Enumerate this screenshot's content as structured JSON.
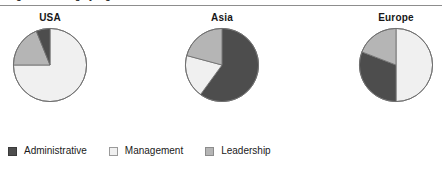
{
  "figure": {
    "caption_fragment": "Figure 3  Staffing by region",
    "rule_color": "#8d8d8d",
    "background": "#ffffff"
  },
  "legend": {
    "position": "bottom-left",
    "items": [
      {
        "label": "Administrative",
        "color": "#4d4d4d",
        "border": "#3a3a3a",
        "swatch_name": "swatch-administrative"
      },
      {
        "label": "Management",
        "color": "#f0f0f0",
        "border": "#9a9a9a",
        "swatch_name": "swatch-management"
      },
      {
        "label": "Leadership",
        "color": "#b5b5b5",
        "border": "#8c8c8c",
        "swatch_name": "swatch-leadership"
      }
    ]
  },
  "chart_data": {
    "type": "pie",
    "title": "Figure 3  Staffing by region",
    "xlabel": "",
    "ylabel": "",
    "grid": false,
    "legend_position": "bottom-left",
    "categories": [
      "Administrative",
      "Management",
      "Leadership"
    ],
    "colors": {
      "Administrative": "#4d4d4d",
      "Management": "#f0f0f0",
      "Leadership": "#b5b5b5"
    },
    "units": "percent",
    "charts": [
      {
        "title": "USA",
        "center_x": 50,
        "center_y": 75,
        "radius": 38,
        "slices": [
          {
            "name": "Management",
            "value": 75,
            "start_deg": 0,
            "end_deg": 270,
            "color": "#f0f0f0"
          },
          {
            "name": "Leadership",
            "value": 19,
            "start_deg": 270,
            "end_deg": 338,
            "color": "#b5b5b5"
          },
          {
            "name": "Administrative",
            "value": 6,
            "start_deg": 338,
            "end_deg": 360,
            "color": "#4d4d4d"
          }
        ]
      },
      {
        "title": "Asia",
        "center_x": 222,
        "center_y": 75,
        "radius": 38,
        "slices": [
          {
            "name": "Administrative",
            "value": 60,
            "start_deg": 0,
            "end_deg": 216,
            "color": "#4d4d4d"
          },
          {
            "name": "Management",
            "value": 19,
            "start_deg": 216,
            "end_deg": 285,
            "color": "#f0f0f0"
          },
          {
            "name": "Leadership",
            "value": 21,
            "start_deg": 285,
            "end_deg": 360,
            "color": "#b5b5b5"
          }
        ]
      },
      {
        "title": "Europe",
        "center_x": 396,
        "center_y": 75,
        "radius": 38,
        "slices": [
          {
            "name": "Management",
            "value": 50,
            "start_deg": 0,
            "end_deg": 180,
            "color": "#f0f0f0"
          },
          {
            "name": "Administrative",
            "value": 31,
            "start_deg": 180,
            "end_deg": 291,
            "color": "#4d4d4d"
          },
          {
            "name": "Leadership",
            "value": 19,
            "start_deg": 291,
            "end_deg": 360,
            "color": "#b5b5b5"
          }
        ]
      }
    ]
  }
}
